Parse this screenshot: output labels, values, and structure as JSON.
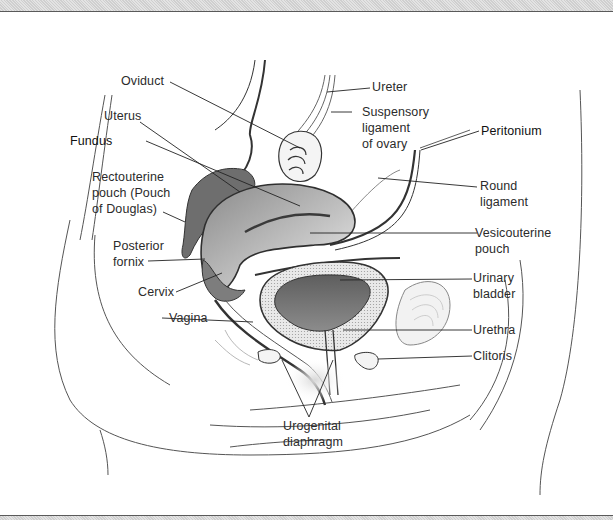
{
  "figure": {
    "type": "anatomical-diagram",
    "colors": {
      "line": "#3a3a3a",
      "dark_fill": "#6e6e6e",
      "mid_fill": "#a8a8a8",
      "light_fill": "#dcdcdc",
      "label_text": "#2b2b2b",
      "frame_band": "#d9d9d9"
    }
  },
  "labels": {
    "oviduct": "Oviduct",
    "uterus": "Uterus",
    "fundus": "Fundus",
    "rectouterine_pouch": "Rectouterine\npouch (Pouch\nof Douglas)",
    "posterior_fornix": "Posterior\nfornix",
    "cervix": "Cervix",
    "vagina": "Vagina",
    "ureter": "Ureter",
    "suspensory_ligament": "Suspensory\nligament\nof ovary",
    "peritonium": "Peritonium",
    "round_ligament": "Round\nligament",
    "vesicouterine_pouch": "Vesicouterine\npouch",
    "urinary_bladder": "Urinary\nbladder",
    "urethra": "Urethra",
    "clitoris": "Clitoris",
    "urogenital_diaphragm": "Urogenital\ndiaphragm"
  }
}
